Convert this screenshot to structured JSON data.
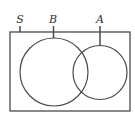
{
  "diagram": {
    "type": "venn",
    "universe": {
      "label": "S",
      "rect": {
        "x": 10,
        "y": 32,
        "width": 120,
        "height": 79
      }
    },
    "sets": [
      {
        "label": "B",
        "cx": 54,
        "cy": 72,
        "r": 34,
        "label_x": 53
      },
      {
        "label": "A",
        "cx": 100,
        "cy": 72.5,
        "r": 27,
        "label_x": 100
      }
    ],
    "stroke_color": "#4a4a4a",
    "label_color": "#333333"
  }
}
